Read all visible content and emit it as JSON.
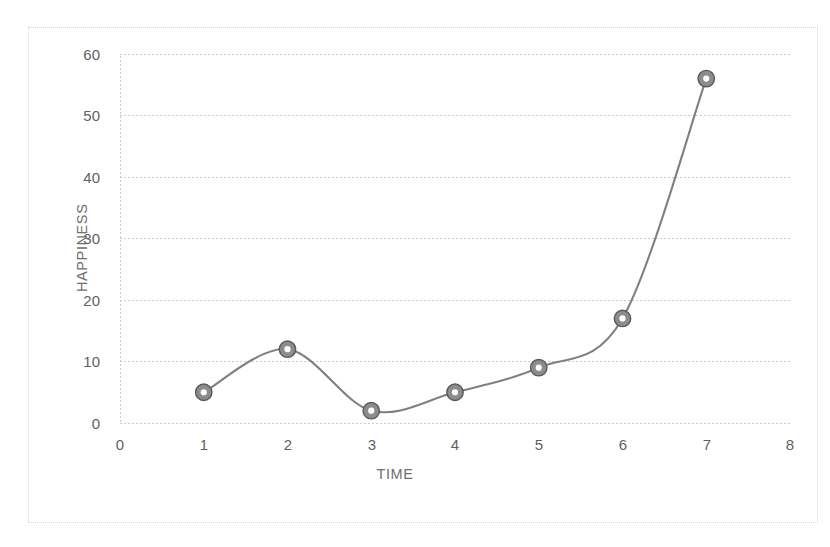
{
  "chart_data": {
    "type": "line",
    "title": "",
    "xlabel": "TIME",
    "ylabel": "HAPPINESS",
    "x": [
      1,
      2,
      3,
      4,
      5,
      6,
      7
    ],
    "values": [
      5,
      12,
      2,
      5,
      9,
      17,
      56
    ],
    "series": [
      {
        "name": "Happiness over time",
        "x": [
          1,
          2,
          3,
          4,
          5,
          6,
          7
        ],
        "values": [
          5,
          12,
          2,
          5,
          9,
          17,
          56
        ]
      }
    ],
    "xlim": [
      0,
      8
    ],
    "ylim": [
      0,
      60
    ],
    "xticks": [
      "0",
      "1",
      "2",
      "3",
      "4",
      "5",
      "6",
      "7",
      "8"
    ],
    "yticks": [
      "0",
      "10",
      "20",
      "30",
      "40",
      "50",
      "60"
    ],
    "grid": "horizontal",
    "legend": "none",
    "smooth": true,
    "line_color": "#808080",
    "marker_color": "#8c8c8c",
    "marker_edge_color": "#595959",
    "marker_shape": "circle",
    "gridline_color": "#d0d0d0",
    "axis_color": "#d0d0d0",
    "text_color": "#5f5f5f",
    "background": "#ffffff",
    "border_color": "#d8d8d8"
  }
}
